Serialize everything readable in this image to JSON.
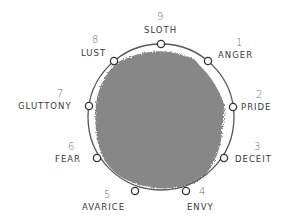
{
  "diagram": {
    "title": "",
    "circle": {
      "cx": 161,
      "cy": 117,
      "r": 73,
      "stroke": "#555555"
    },
    "blob_color": "#7d7d7d",
    "nodes": [
      {
        "number": "9",
        "label": "SLOTH",
        "x": 161,
        "y": 44
      },
      {
        "number": "1",
        "label": "ANGER",
        "x": 208,
        "y": 61
      },
      {
        "number": "2",
        "label": "PRIDE",
        "x": 233,
        "y": 107
      },
      {
        "number": "3",
        "label": "DECEIT",
        "x": 224,
        "y": 158
      },
      {
        "number": "4",
        "label": "ENVY",
        "x": 186,
        "y": 191
      },
      {
        "number": "5",
        "label": "AVARICE",
        "x": 135,
        "y": 191
      },
      {
        "number": "6",
        "label": "FEAR",
        "x": 97,
        "y": 158
      },
      {
        "number": "7",
        "label": "GLUTTONY",
        "x": 89,
        "y": 106
      },
      {
        "number": "8",
        "label": "LUST",
        "x": 114,
        "y": 61
      }
    ]
  }
}
